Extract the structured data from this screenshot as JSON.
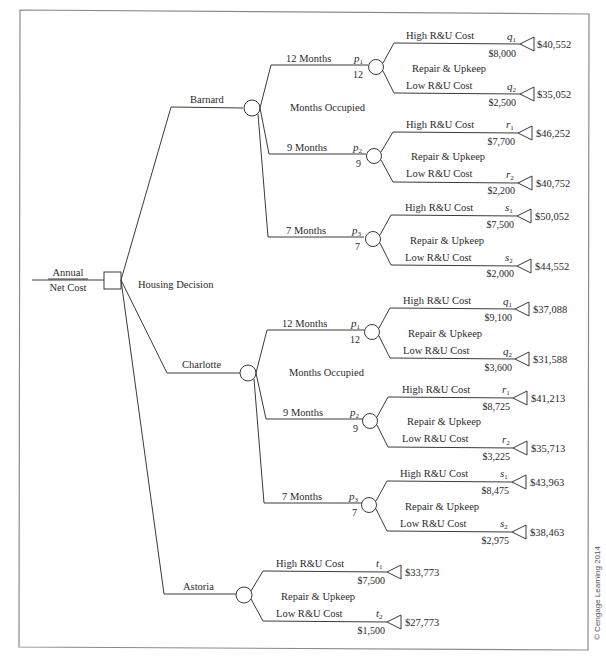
{
  "root": {
    "label_line1": "Annual",
    "label_line2": "Net Cost",
    "decision_label": "Housing Decision"
  },
  "copyright": "© Cengage Learning 2014",
  "branches": [
    {
      "name": "Barnard",
      "chance_label": "Months Occupied",
      "months": [
        {
          "label": "12 Months",
          "prob": "p",
          "prob_sub": "1",
          "value": "12",
          "ru_label": "Repair & Upkeep",
          "high": {
            "label": "High R&U Cost",
            "prob": "q",
            "prob_sub": "1",
            "cost": "$8,000",
            "payoff": "$40,552"
          },
          "low": {
            "label": "Low R&U Cost",
            "prob": "q",
            "prob_sub": "2",
            "cost": "$2,500",
            "payoff": "$35,052"
          }
        },
        {
          "label": "9 Months",
          "prob": "p",
          "prob_sub": "2",
          "value": "9",
          "ru_label": "Repair & Upkeep",
          "high": {
            "label": "High R&U Cost",
            "prob": "r",
            "prob_sub": "1",
            "cost": "$7,700",
            "payoff": "$46,252"
          },
          "low": {
            "label": "Low R&U Cost",
            "prob": "r",
            "prob_sub": "2",
            "cost": "$2,200",
            "payoff": "$40,752"
          }
        },
        {
          "label": "7 Months",
          "prob": "p",
          "prob_sub": "3",
          "value": "7",
          "ru_label": "Repair & Upkeep",
          "high": {
            "label": "High R&U Cost",
            "prob": "s",
            "prob_sub": "1",
            "cost": "$7,500",
            "payoff": "$50,052"
          },
          "low": {
            "label": "Low R&U Cost",
            "prob": "s",
            "prob_sub": "2",
            "cost": "$2,000",
            "payoff": "$44,552"
          }
        }
      ]
    },
    {
      "name": "Charlotte",
      "chance_label": "Months Occupied",
      "months": [
        {
          "label": "12 Months",
          "prob": "p",
          "prob_sub": "1",
          "value": "12",
          "ru_label": "Repair & Upkeep",
          "high": {
            "label": "High R&U Cost",
            "prob": "q",
            "prob_sub": "1",
            "cost": "$9,100",
            "payoff": "$37,088"
          },
          "low": {
            "label": "Low R&U Cost",
            "prob": "q",
            "prob_sub": "2",
            "cost": "$3,600",
            "payoff": "$31,588"
          }
        },
        {
          "label": "9 Months",
          "prob": "p",
          "prob_sub": "2",
          "value": "9",
          "ru_label": "Repair & Upkeep",
          "high": {
            "label": "High R&U Cost",
            "prob": "r",
            "prob_sub": "1",
            "cost": "$8,725",
            "payoff": "$41,213"
          },
          "low": {
            "label": "Low R&U Cost",
            "prob": "r",
            "prob_sub": "2",
            "cost": "$3,225",
            "payoff": "$35,713"
          }
        },
        {
          "label": "7 Months",
          "prob": "p",
          "prob_sub": "3",
          "value": "7",
          "ru_label": "Repair & Upkeep",
          "high": {
            "label": "High R&U Cost",
            "prob": "s",
            "prob_sub": "1",
            "cost": "$8,475",
            "payoff": "$43,963"
          },
          "low": {
            "label": "Low R&U Cost",
            "prob": "s",
            "prob_sub": "2",
            "cost": "$2,975",
            "payoff": "$38,463"
          }
        }
      ]
    },
    {
      "name": "Astoria",
      "ru_label": "Repair & Upkeep",
      "high": {
        "label": "High R&U Cost",
        "prob": "t",
        "prob_sub": "1",
        "cost": "$7,500",
        "payoff": "$33,773"
      },
      "low": {
        "label": "Low R&U Cost",
        "prob": "t",
        "prob_sub": "2",
        "cost": "$1,500",
        "payoff": "$27,773"
      }
    }
  ]
}
